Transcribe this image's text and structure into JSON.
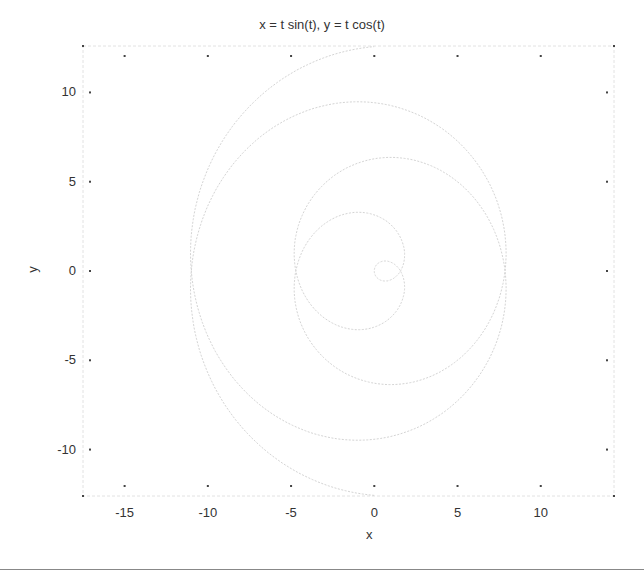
{
  "chart_data": {
    "type": "line",
    "title": "x = t sin(t), y = t cos(t)",
    "xlabel": "x",
    "ylabel": "y",
    "xlim": [
      -17.5,
      14.4
    ],
    "ylim": [
      -12.6,
      12.6
    ],
    "xticks": [
      -15,
      -10,
      -5,
      0,
      5,
      10
    ],
    "xtick_labels": [
      "-15",
      "-10",
      "-5",
      "0",
      "5",
      "10"
    ],
    "yticks": [
      10,
      5,
      0,
      -5,
      -10
    ],
    "ytick_labels": [
      "10",
      "5",
      "0",
      "-5",
      "-10"
    ],
    "grid": false,
    "legend": null,
    "series": [
      {
        "name": "parametric spiral",
        "equation": {
          "x": "t*sin(t)",
          "y": "t*cos(t)"
        },
        "t_range": [
          -12.566,
          12.566
        ],
        "color": "#d4d4d4"
      }
    ]
  },
  "colors": {
    "axes": "#dcdcdc",
    "tick": "#444444",
    "curve": "#d4d4d4",
    "text": "#333333",
    "rule": "#888888"
  }
}
